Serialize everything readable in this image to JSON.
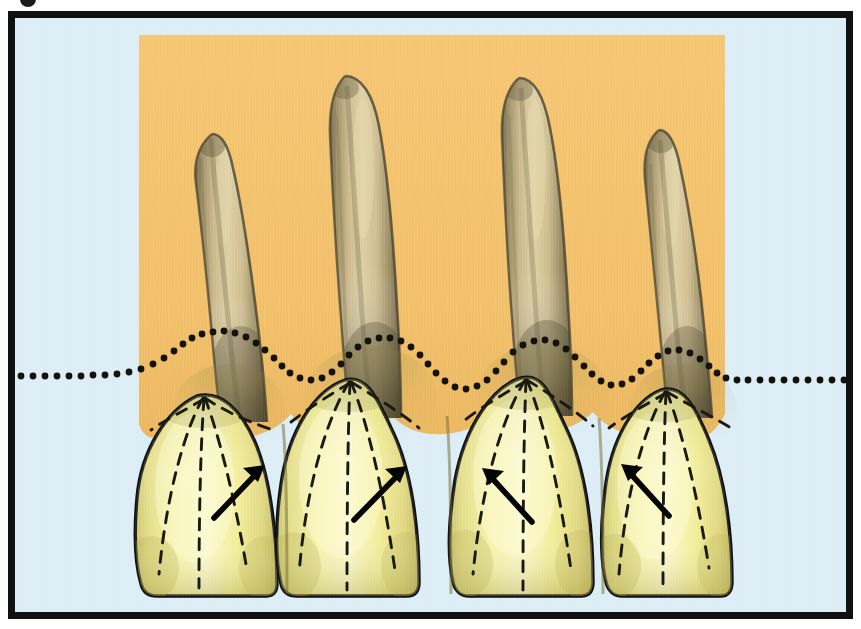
{
  "figure": {
    "corner_mark": "page-dot",
    "frame_color": "#111111",
    "background_color": "#ffffff"
  },
  "canvas": {
    "width": 861,
    "height": 629
  },
  "palette": {
    "plate_background": "#dcedf5",
    "gingiva_panel": "#f2c06a",
    "gingiva_panel_shadow": "#e3ab53",
    "root_base": "#c9b484",
    "root_mid": "#a99a6d",
    "root_dark": "#6e6447",
    "root_highlight": "#ddcc9d",
    "crown_base": "#f2ee92",
    "crown_highlight": "#f8f7c2",
    "crown_shadow": "#d8d06a",
    "crown_cervical_shade": "#c9c06a",
    "outline": "#111111",
    "dashed_line": "#1a1a12",
    "dotted_line": "#14120a",
    "arrow": "#050505"
  },
  "gingiva_panel": {
    "label": "gingival-tissue-panel",
    "x": 132,
    "y": 28,
    "width": 602,
    "height": 412,
    "scallop_depth": 26
  },
  "gingival_margin": {
    "label": "dotted-gingival-margin-line",
    "style": "dotted",
    "dot_radius": 3.4,
    "dot_spacing": 11,
    "baseline_y": 381,
    "peak_rise": 36,
    "description": "Undulating dotted line tracing the cemento-enamel junction / gingival scallop across four teeth"
  },
  "teeth": [
    {
      "id": 1,
      "name": "tooth-1",
      "position": "left-lateral",
      "crown_center_x": 210,
      "crown_left": 136,
      "crown_right": 286,
      "crown_top_y": 402,
      "incisal_edge_y": 582,
      "root_tip_x": 205,
      "root_tip_y": 144,
      "root_tip_lean": "distal-left",
      "lobe_lines": 4,
      "arrow": {
        "name": "growth-direction-arrow-1",
        "from_x": 207,
        "from_y": 494,
        "to_x": 248,
        "to_y": 452,
        "direction": "up-right"
      }
    },
    {
      "id": 2,
      "name": "tooth-2",
      "position": "left-central",
      "crown_center_x": 350,
      "crown_left": 284,
      "crown_right": 428,
      "crown_top_y": 388,
      "incisal_edge_y": 585,
      "root_tip_x": 342,
      "root_tip_y": 86,
      "root_tip_lean": "straight",
      "lobe_lines": 4,
      "arrow": {
        "name": "growth-direction-arrow-2",
        "from_x": 346,
        "from_y": 496,
        "to_x": 390,
        "to_y": 452,
        "direction": "up-right"
      }
    },
    {
      "id": 3,
      "name": "tooth-3",
      "position": "right-central",
      "crown_center_x": 524,
      "crown_left": 442,
      "crown_right": 594,
      "crown_top_y": 386,
      "incisal_edge_y": 585,
      "root_tip_x": 516,
      "root_tip_y": 88,
      "root_tip_lean": "straight",
      "lobe_lines": 4,
      "arrow": {
        "name": "growth-direction-arrow-3",
        "from_x": 512,
        "from_y": 498,
        "to_x": 470,
        "to_y": 452,
        "direction": "up-left"
      }
    },
    {
      "id": 4,
      "name": "tooth-4",
      "position": "right-lateral",
      "crown_center_x": 664,
      "crown_left": 600,
      "crown_right": 730,
      "crown_top_y": 398,
      "incisal_edge_y": 580,
      "root_tip_x": 652,
      "root_tip_y": 142,
      "root_tip_lean": "distal-right",
      "lobe_lines": 4,
      "arrow": {
        "name": "growth-direction-arrow-4",
        "from_x": 650,
        "from_y": 492,
        "to_x": 612,
        "to_y": 450,
        "direction": "up-left"
      }
    }
  ],
  "annotations": {
    "dashed_lobe_lines_note": "Dashed lines radiate from the incisal apex down to the cervical and proximal margins marking the developmental lobes",
    "arrow_note": "Arrows indicate the direction of eruption / contour sweep on each crown"
  }
}
